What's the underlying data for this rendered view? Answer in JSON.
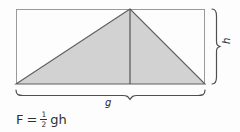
{
  "figure": {
    "colors": {
      "background": "#fdfdfd",
      "rect_stroke": "#9a9a9a",
      "triangle_fill": "#d2d2d2",
      "triangle_stroke": "#5f5f5f",
      "median_stroke": "#4a4a4a",
      "brace_stroke": "#4f4f4f",
      "text": "#2b2b2b"
    },
    "rectangle": {
      "x": 16,
      "y": 9,
      "width": 189,
      "height": 75
    },
    "triangle": {
      "vertices": [
        [
          16,
          84
        ],
        [
          130,
          9
        ],
        [
          205,
          84
        ]
      ],
      "median": [
        [
          130,
          9
        ],
        [
          130,
          84
        ]
      ]
    },
    "labels": {
      "base": "g",
      "height": "h"
    },
    "formula": {
      "lhs": "F",
      "equals": "=",
      "fraction_numerator": "1",
      "fraction_denominator": "2",
      "rhs": "gh",
      "full": "F = 1/2 gh"
    },
    "braces": {
      "bottom_brace_name": "base-brace",
      "right_brace_name": "height-brace"
    }
  }
}
